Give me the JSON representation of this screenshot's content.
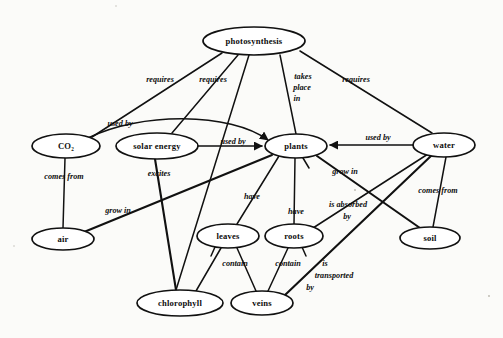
{
  "diagram": {
    "background_color": "#fbfbf9",
    "ink_color": "#111111",
    "nodes": [
      {
        "id": "photosynthesis",
        "label": "photosynthesis",
        "x": 254,
        "y": 41,
        "rx": 51,
        "ry": 14
      },
      {
        "id": "co2",
        "label": "CO₂",
        "x": 66,
        "y": 146,
        "rx": 34,
        "ry": 12
      },
      {
        "id": "solar_energy",
        "label": "solar energy",
        "x": 157,
        "y": 146,
        "rx": 41,
        "ry": 13
      },
      {
        "id": "plants",
        "label": "plants",
        "x": 296,
        "y": 146,
        "rx": 31,
        "ry": 12
      },
      {
        "id": "water",
        "label": "water",
        "x": 444,
        "y": 145,
        "rx": 31,
        "ry": 12
      },
      {
        "id": "air",
        "label": "air",
        "x": 63,
        "y": 239,
        "rx": 31,
        "ry": 11
      },
      {
        "id": "leaves",
        "label": "leaves",
        "x": 228,
        "y": 236,
        "rx": 31,
        "ry": 12
      },
      {
        "id": "roots",
        "label": "roots",
        "x": 294,
        "y": 236,
        "rx": 29,
        "ry": 12
      },
      {
        "id": "soil",
        "label": "soil",
        "x": 430,
        "y": 238,
        "rx": 30,
        "ry": 11
      },
      {
        "id": "chlorophyll",
        "label": "chlorophyll",
        "x": 180,
        "y": 303,
        "rx": 43,
        "ry": 13
      },
      {
        "id": "veins",
        "label": "veins",
        "x": 262,
        "y": 303,
        "rx": 31,
        "ry": 12
      }
    ],
    "edges": [
      {
        "id": "photosynthesis-co2",
        "from": "photosynthesis",
        "to": "co2",
        "label": "requires",
        "label_x": 160,
        "label_y": 80
      },
      {
        "id": "photosynthesis-solar",
        "from": "photosynthesis",
        "to": "solar_energy",
        "label": "requires",
        "label_x": 213,
        "label_y": 80
      },
      {
        "id": "photosynthesis-chlorophyll",
        "from": "photosynthesis",
        "to": "chlorophyll",
        "label": "",
        "label_x": 0,
        "label_y": 0
      },
      {
        "id": "photosynthesis-plants",
        "from": "photosynthesis",
        "to": "plants",
        "label": "takes place in",
        "label_x": 301,
        "label_y": 86
      },
      {
        "id": "photosynthesis-water",
        "from": "photosynthesis",
        "to": "water",
        "label": "requires",
        "label_x": 356,
        "label_y": 80
      },
      {
        "id": "co2-plants",
        "from": "co2",
        "to": "plants",
        "label": "used by",
        "label_x": 120,
        "label_y": 124
      },
      {
        "id": "solar-plants",
        "from": "solar_energy",
        "to": "plants",
        "label": "used by",
        "label_x": 233,
        "label_y": 142
      },
      {
        "id": "water-plants",
        "from": "water",
        "to": "plants",
        "label": "used by",
        "label_x": 378,
        "label_y": 138
      },
      {
        "id": "co2-air",
        "from": "co2",
        "to": "air",
        "label": "comes from",
        "label_x": 64,
        "label_y": 177
      },
      {
        "id": "solar-chlorophyll",
        "from": "solar_energy",
        "to": "chlorophyll",
        "label": "excites",
        "label_x": 159,
        "label_y": 174
      },
      {
        "id": "plants-air",
        "from": "plants",
        "to": "air",
        "label": "grow in",
        "label_x": 118,
        "label_y": 211
      },
      {
        "id": "plants-leaves",
        "from": "plants",
        "to": "leaves",
        "label": "have",
        "label_x": 252,
        "label_y": 197
      },
      {
        "id": "plants-roots",
        "from": "plants",
        "to": "roots",
        "label": "have",
        "label_x": 296,
        "label_y": 210
      },
      {
        "id": "plants-soil",
        "from": "plants",
        "to": "soil",
        "label": "grow in",
        "label_x": 345,
        "label_y": 172
      },
      {
        "id": "water-roots",
        "from": "water",
        "to": "roots",
        "label": "is absorbed by",
        "label_x": 347,
        "label_y": 209
      },
      {
        "id": "water-soil",
        "from": "water",
        "to": "soil",
        "label": "comes from",
        "label_x": 438,
        "label_y": 191
      },
      {
        "id": "leaves-chlorophyll",
        "from": "leaves",
        "to": "chlorophyll",
        "label": "contain",
        "label_x": 235,
        "label_y": 264
      },
      {
        "id": "leaves-veins",
        "from": "leaves",
        "to": "veins",
        "label": "",
        "label_x": 0,
        "label_y": 0
      },
      {
        "id": "roots-veins",
        "from": "roots",
        "to": "veins",
        "label": "contain",
        "label_x": 288,
        "label_y": 264
      },
      {
        "id": "water-veins",
        "from": "water",
        "to": "veins",
        "label": "is transported by",
        "label_x": 331,
        "label_y": 271
      }
    ],
    "edge_labels": {
      "requires_1": "requires",
      "requires_2": "requires",
      "requires_3": "requires",
      "takes_place_in_line1": "takes",
      "takes_place_in_line2": "place",
      "takes_place_in_line3": "in",
      "used_by_1": "used by",
      "used_by_2": "used by",
      "used_by_3": "used by",
      "comes_from_1": "comes from",
      "comes_from_2": "comes from",
      "excites": "excites",
      "grow_in_1": "grow in",
      "grow_in_2": "grow in",
      "have_1": "have",
      "have_2": "have",
      "is_absorbed_line1": "is absorbed",
      "is_absorbed_line2": "by",
      "contain_1": "contain",
      "contain_2": "contain",
      "is_transported_line1": "is",
      "is_transported_line2": "transported",
      "is_transported_line3": "by"
    }
  }
}
